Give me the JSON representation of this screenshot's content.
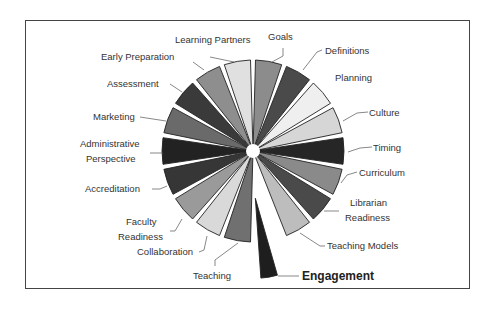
{
  "diagram": {
    "type": "exploded-pie",
    "center": [
      253,
      151
    ],
    "radius": 91,
    "slices": [
      {
        "label": "Goals",
        "color": "#8c8c8c"
      },
      {
        "label": "Definitions",
        "color": "#4a4a4a"
      },
      {
        "label": "Planning",
        "color": "#efefef"
      },
      {
        "label": "Culture",
        "color": "#d6d6d6"
      },
      {
        "label": "Timing",
        "color": "#262626"
      },
      {
        "label": "Curriculum",
        "color": "#8a8a8a"
      },
      {
        "label": "Librarian Readiness",
        "color": "#4a4a4a"
      },
      {
        "label": "Teaching Models",
        "color": "#bdbdbd"
      },
      {
        "label": "Engagement",
        "color": "#1e1e1e",
        "exploded": true,
        "emphasis": true
      },
      {
        "label": "Teaching",
        "color": "#707070"
      },
      {
        "label": "Collaboration",
        "color": "#d9d9d9"
      },
      {
        "label": "Faculty Readiness",
        "color": "#9a9a9a"
      },
      {
        "label": "Accreditation",
        "color": "#363636"
      },
      {
        "label": "Administrative Perspective",
        "color": "#222222"
      },
      {
        "label": "Marketing",
        "color": "#6a6a6a"
      },
      {
        "label": "Assessment",
        "color": "#3a3a3a"
      },
      {
        "label": "Early Preparation",
        "color": "#8e8e8e"
      },
      {
        "label": "Learning Partners",
        "color": "#e0e0e0"
      }
    ]
  },
  "labels": {
    "goals": "Goals",
    "definitions": "Definitions",
    "planning": "Planning",
    "culture": "Culture",
    "timing": "Timing",
    "curriculum": "Curriculum",
    "librarian_1": "Librarian",
    "librarian_2": "Readiness",
    "teaching_models": "Teaching Models",
    "engagement": "Engagement",
    "teaching": "Teaching",
    "collaboration": "Collaboration",
    "faculty_1": "Faculty",
    "faculty_2": "Readiness",
    "accreditation": "Accreditation",
    "admin_1": "Administrative",
    "admin_2": "Perspective",
    "marketing": "Marketing",
    "assessment": "Assessment",
    "early_preparation": "Early Preparation",
    "learning_partners": "Learning Partners"
  }
}
